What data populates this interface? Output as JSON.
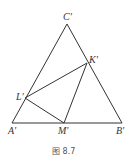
{
  "figure": {
    "caption": "图 8.7",
    "points": {
      "A": "A'",
      "B": "B'",
      "C": "C'",
      "K": "K'",
      "L": "L'",
      "M": "M'"
    },
    "segments": [
      [
        "A'",
        "B'"
      ],
      [
        "B'",
        "C'"
      ],
      [
        "C'",
        "A'"
      ],
      [
        "L'",
        "K'"
      ],
      [
        "K'",
        "M'"
      ],
      [
        "M'",
        "L'"
      ]
    ]
  }
}
